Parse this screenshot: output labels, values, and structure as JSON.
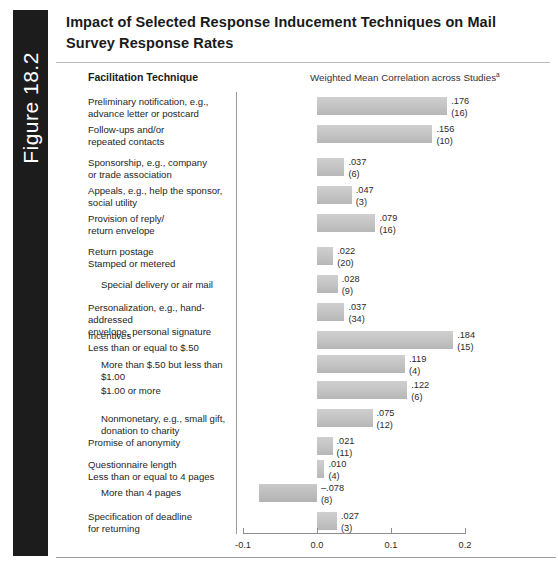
{
  "figure": {
    "tab_label": "Figure 18.2"
  },
  "title": "Impact of Selected Response Inducement Techniques on Mail Survey Response Rates",
  "headers": {
    "left": "Facilitation Technique",
    "right": "Weighted Mean Correlation across Studies",
    "right_superscript": "a"
  },
  "chart_data": {
    "type": "bar",
    "orientation": "horizontal",
    "title": "Impact of Selected Response Inducement Techniques on Mail Survey Response Rates",
    "xlabel": "Weighted Mean Correlation across Studies",
    "ylabel": "Facilitation Technique",
    "xlim": [
      -0.1,
      0.2
    ],
    "xticks": [
      -0.1,
      0.0,
      0.1,
      0.2
    ],
    "xtick_labels": [
      "-0.1",
      "0.0",
      "0.1",
      "0.2"
    ],
    "grid": false,
    "legend": "none",
    "bar_color": "#c3c3c3",
    "categories": [
      "Preliminary notification, e.g.,\nadvance letter or postcard",
      "Follow-ups and/or\nrepeated contacts",
      "Sponsorship, e.g., company\nor trade association",
      "Appeals, e.g., help the sponsor,\nsocial utility",
      "Provision of reply/\nreturn envelope",
      "Return postage\n  Stamped or metered",
      "Special delivery or air mail",
      "Personalization, e.g., hand-addressed\nenvelope, personal signature",
      "Incentives\n  Less than or equal to $.50",
      "More than $.50 but less than $1.00",
      "$1.00 or more",
      "Nonmonetary, e.g., small gift,\ndonation to charity",
      "Promise of anonymity",
      "Questionnaire length\n  Less than or equal to 4 pages",
      "More than 4 pages",
      "Specification of deadline\nfor returning"
    ],
    "values": [
      0.176,
      0.156,
      0.037,
      0.047,
      0.079,
      0.022,
      0.028,
      0.037,
      0.184,
      0.119,
      0.122,
      0.075,
      0.021,
      0.01,
      -0.078,
      0.027
    ],
    "value_labels": [
      ".176",
      ".156",
      ".037",
      ".047",
      ".079",
      ".022",
      ".028",
      ".037",
      ".184",
      ".119",
      ".122",
      ".075",
      ".021",
      ".010",
      "–.078",
      ".027"
    ],
    "study_counts": [
      16,
      10,
      6,
      3,
      16,
      20,
      9,
      34,
      15,
      4,
      6,
      12,
      11,
      4,
      8,
      3
    ],
    "study_count_labels": [
      "(16)",
      "(10)",
      "(6)",
      "(3)",
      "(16)",
      "(20)",
      "(9)",
      "(34)",
      "(15)",
      "(4)",
      "(6)",
      "(12)",
      "(11)",
      "(4)",
      "(8)",
      "(3)"
    ]
  },
  "rows": [
    {
      "label": "Preliminary notification, e.g.,\nadvance letter or postcard",
      "indent": 0,
      "value": ".176",
      "count": "(16)"
    },
    {
      "label": "Follow-ups and/or\nrepeated contacts",
      "indent": 0,
      "value": ".156",
      "count": "(10)"
    },
    {
      "label": "Sponsorship, e.g., company\nor trade association",
      "indent": 0,
      "value": ".037",
      "count": "(6)"
    },
    {
      "label": "Appeals, e.g., help the sponsor,\nsocial utility",
      "indent": 0,
      "value": ".047",
      "count": "(3)"
    },
    {
      "label": "Provision of reply/\nreturn envelope",
      "indent": 0,
      "value": ".079",
      "count": "(16)"
    },
    {
      "label": "Return postage\n   Stamped or metered",
      "indent": 0,
      "value": ".022",
      "count": "(20)"
    },
    {
      "label": "Special delivery or air mail",
      "indent": 2,
      "value": ".028",
      "count": "(9)"
    },
    {
      "label": "Personalization, e.g., hand-addressed\nenvelope, personal signature",
      "indent": 0,
      "value": ".037",
      "count": "(34)"
    },
    {
      "label": "Incentives\n   Less than or equal to $.50",
      "indent": 0,
      "value": ".184",
      "count": "(15)"
    },
    {
      "label": "More than $.50 but less than $1.00",
      "indent": 2,
      "value": ".119",
      "count": "(4)"
    },
    {
      "label": "$1.00 or more",
      "indent": 2,
      "value": ".122",
      "count": "(6)"
    },
    {
      "label": "Nonmonetary, e.g., small gift,\ndonation to charity",
      "indent": 2,
      "value": ".075",
      "count": "(12)"
    },
    {
      "label": "Promise of anonymity",
      "indent": 0,
      "value": ".021",
      "count": "(11)"
    },
    {
      "label": "Questionnaire length\n   Less than or equal to 4 pages",
      "indent": 0,
      "value": ".010",
      "count": "(4)"
    },
    {
      "label": "More than 4 pages",
      "indent": 2,
      "value": "–.078",
      "count": "(8)"
    },
    {
      "label": "Specification of deadline\nfor returning",
      "indent": 0,
      "value": ".027",
      "count": "(3)"
    }
  ]
}
